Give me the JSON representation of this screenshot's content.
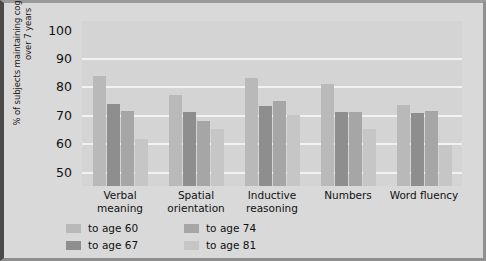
{
  "chart_data": {
    "type": "bar",
    "title": "",
    "xlabel": "",
    "ylabel": "% of subjects maintaining cognitive abilities over 7 years",
    "categories": [
      "Verbal meaning",
      "Spatial orientation",
      "Inductive reasoning",
      "Numbers",
      "Word fluency"
    ],
    "category_lines": [
      [
        "Verbal",
        "meaning"
      ],
      [
        "Spatial",
        "orientation"
      ],
      [
        "Inductive",
        "reasoning"
      ],
      [
        "Numbers"
      ],
      [
        "Word fluency"
      ]
    ],
    "series": [
      {
        "name": "to age 60",
        "color": "#b9b9b9",
        "values": [
          83.5,
          77,
          83,
          81,
          73.5
        ]
      },
      {
        "name": "to age 67",
        "color": "#8e8e8e",
        "values": [
          74,
          71,
          73,
          71,
          70.5
        ]
      },
      {
        "name": "to age 74",
        "color": "#a6a6a6",
        "values": [
          71.5,
          68,
          75,
          71,
          71.5
        ]
      },
      {
        "name": "to age 81",
        "color": "#c6c6c6",
        "values": [
          61.5,
          65,
          70,
          65,
          59.5
        ]
      }
    ],
    "ylim": [
      45,
      103
    ],
    "yticks": [
      50,
      60,
      70,
      80,
      90,
      100
    ],
    "gridlines": [
      50,
      60,
      70,
      80,
      90
    ],
    "grid": true,
    "legend_position": "bottom-left",
    "legend_order": [
      "to age 60",
      "to age 67",
      "to age 74",
      "to age 81"
    ]
  },
  "colors": {
    "figure_background": "#d9d9d9",
    "plot_background": "#d4d4d4",
    "gridline": "#f2f2f2",
    "text": "#111111"
  }
}
